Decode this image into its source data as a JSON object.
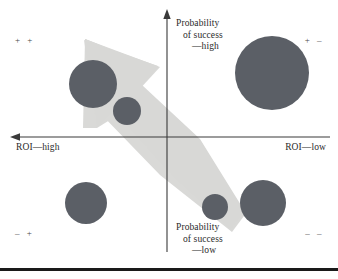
{
  "figure": {
    "title": "",
    "background_color": "#ffffff",
    "width": 338,
    "height": 279
  },
  "axes": {
    "vertical": {
      "name": "probability-of-success-axis",
      "x": 167,
      "top_label_lines": [
        "Probability",
        "of success",
        "—high"
      ],
      "bottom_label_lines": [
        "Probability",
        "of success",
        "—low"
      ],
      "color": "#3a3a3a",
      "arrow_direction": "up"
    },
    "horizontal": {
      "name": "roi-axis",
      "y": 137,
      "left_label": "ROI—high",
      "right_label": "ROI—low",
      "color": "#3a3a3a",
      "arrow_direction": "left"
    }
  },
  "quadrant_marks": {
    "top_left": "+  +",
    "top_right": "+  –",
    "bottom_left": "–  +",
    "bottom_right": "–  –"
  },
  "arrow": {
    "name": "strategy-direction-arrow",
    "color": "#d8d8d6",
    "direction": "up-left",
    "description": "Large translucent block arrow pointing toward the high-ROI / high-probability quadrant"
  },
  "chart_data": {
    "type": "scatter",
    "title": "",
    "xlabel": "ROI",
    "ylabel": "Probability of success",
    "xlim": [
      0,
      338
    ],
    "ylim": [
      0,
      265
    ],
    "grid": false,
    "legend": null,
    "axis_origin": [
      167,
      137
    ],
    "bubble_color": "#5b5f66",
    "bubbles": [
      {
        "label": "",
        "cx": 93,
        "cy": 84,
        "r": 24,
        "quadrant": "+ +"
      },
      {
        "label": "",
        "cx": 127,
        "cy": 111,
        "r": 14,
        "quadrant": "+ +"
      },
      {
        "label": "",
        "cx": 272,
        "cy": 73,
        "r": 37,
        "quadrant": "+ –"
      },
      {
        "label": "",
        "cx": 86,
        "cy": 203,
        "r": 21,
        "quadrant": "– +"
      },
      {
        "label": "",
        "cx": 215,
        "cy": 207,
        "r": 13,
        "quadrant": "– –"
      },
      {
        "label": "",
        "cx": 263,
        "cy": 203,
        "r": 23,
        "quadrant": "– –"
      }
    ]
  }
}
